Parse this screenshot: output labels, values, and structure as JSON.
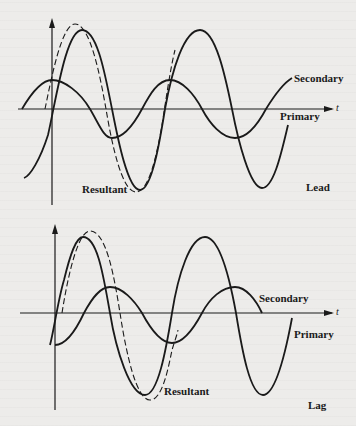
{
  "figure": {
    "panels": [
      {
        "id": "lead",
        "title": "Lead",
        "axis_label": "t",
        "curves": {
          "secondary": "Secondary",
          "primary": "Primary",
          "resultant": "Resultant"
        }
      },
      {
        "id": "lag",
        "title": "Lag",
        "axis_label": "t",
        "curves": {
          "secondary": "Secondary",
          "primary": "Primary",
          "resultant": "Resultant"
        }
      }
    ],
    "legend_styles": {
      "primary": "solid",
      "secondary": "solid",
      "resultant": "dashed"
    },
    "colors": {
      "ink": "#1a1a1a",
      "paper": "#edecea"
    }
  }
}
